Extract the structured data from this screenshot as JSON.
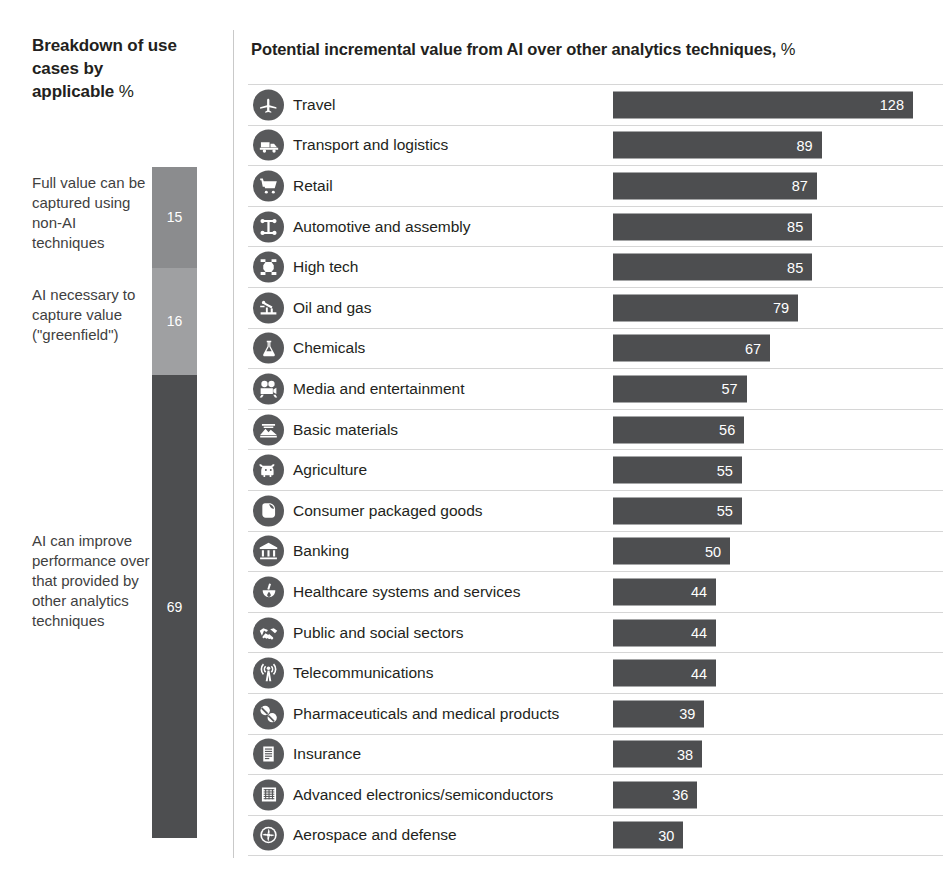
{
  "left": {
    "title_bold": "Breakdown of use cases by applicable",
    "title_tail_bold": "techniques,",
    "title_tail_light": "%",
    "legend": [
      {
        "label": "Full value can be captured using non-AI techniques",
        "value": 15,
        "color": "#8b8c8e"
      },
      {
        "label": "AI necessary to capture value (\"greenfield\")",
        "value": 16,
        "color": "#9fa0a2"
      },
      {
        "label": "AI can improve performance over that provided by other analytics techniques",
        "value": 69,
        "color": "#4d4e50"
      }
    ]
  },
  "right": {
    "title_bold": "Potential incremental value from AI over other analytics techniques,",
    "title_light": "%"
  },
  "chart_data": {
    "type": "bar",
    "orientation": "horizontal",
    "title": "Potential incremental value from AI over other analytics techniques, %",
    "xlabel": "",
    "ylabel": "",
    "xlim": [
      0,
      128
    ],
    "grid": false,
    "legend": "none",
    "value_labels": true,
    "categories": [
      "Travel",
      "Transport and logistics",
      "Retail",
      "Automotive and assembly",
      "High tech",
      "Oil and gas",
      "Chemicals",
      "Media and entertainment",
      "Basic materials",
      "Agriculture",
      "Consumer packaged goods",
      "Banking",
      "Healthcare systems and services",
      "Public and social sectors",
      "Telecommunications",
      "Pharmaceuticals and medical products",
      "Insurance",
      "Advanced electronics/semiconductors",
      "Aerospace and defense"
    ],
    "values": [
      128,
      89,
      87,
      85,
      85,
      79,
      67,
      57,
      56,
      55,
      55,
      50,
      44,
      44,
      44,
      39,
      38,
      36,
      30
    ],
    "icons": [
      "airplane-icon",
      "truck-icon",
      "shopping-cart-icon",
      "car-chassis-icon",
      "microchip-icon",
      "oil-pump-icon",
      "flask-icon",
      "film-camera-icon",
      "ore-pile-icon",
      "cow-icon",
      "package-icon",
      "bank-icon",
      "mortar-pestle-icon",
      "handshake-icon",
      "antenna-tower-icon",
      "pills-icon",
      "document-icon",
      "circuit-board-icon",
      "jet-engine-icon"
    ],
    "bar_color": "#4d4e50",
    "value_label_color": "#ffffff"
  },
  "secondary_chart_data": {
    "type": "stacked_bar",
    "title": "Breakdown of use cases by applicable techniques, %",
    "categories": [
      "Full value can be captured using non-AI techniques",
      "AI necessary to capture value (\"greenfield\")",
      "AI can improve performance over that provided by other analytics techniques"
    ],
    "values": [
      15,
      16,
      69
    ],
    "colors": [
      "#8b8c8e",
      "#9fa0a2",
      "#4d4e50"
    ]
  }
}
